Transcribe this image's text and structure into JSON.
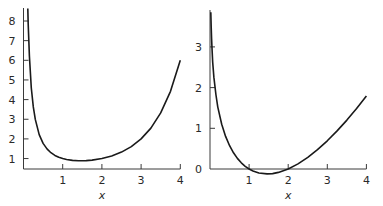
{
  "chart_data": [
    {
      "type": "line",
      "title": "",
      "xlabel": "x",
      "ylabel": "",
      "xlim": [
        0,
        4
      ],
      "ylim": [
        0.55,
        8.5
      ],
      "grid": false,
      "xticks": [
        "1",
        "2",
        "3",
        "4"
      ],
      "yticks": [
        "1",
        "2",
        "3",
        "4",
        "5",
        "6",
        "7",
        "8"
      ],
      "series": [
        {
          "name": "curve",
          "x": [
            0.11,
            0.12,
            0.15,
            0.2,
            0.25,
            0.3,
            0.4,
            0.5,
            0.6,
            0.7,
            0.8,
            0.9,
            1.0,
            1.1,
            1.25,
            1.4,
            1.46,
            1.6,
            1.75,
            2.0,
            2.25,
            2.5,
            2.75,
            3.0,
            3.25,
            3.5,
            3.75,
            4.0
          ],
          "y": [
            8.63,
            7.85,
            6.22,
            4.59,
            3.63,
            2.99,
            2.22,
            1.77,
            1.49,
            1.3,
            1.16,
            1.07,
            1.0,
            0.951,
            0.906,
            0.887,
            0.886,
            0.894,
            0.919,
            1.0,
            1.133,
            1.329,
            1.608,
            2.0,
            2.549,
            3.323,
            4.423,
            6.0
          ]
        }
      ]
    },
    {
      "type": "line",
      "title": "",
      "xlabel": "x",
      "ylabel": "",
      "xlim": [
        0,
        4
      ],
      "ylim": [
        0,
        3.85
      ],
      "grid": false,
      "xticks": [
        "1",
        "2",
        "3",
        "4"
      ],
      "yticks": [
        "0",
        "1",
        "2",
        "3"
      ],
      "series": [
        {
          "name": "curve",
          "x": [
            0.021,
            0.03,
            0.04,
            0.05,
            0.07,
            0.1,
            0.15,
            0.2,
            0.3,
            0.4,
            0.5,
            0.6,
            0.7,
            0.8,
            0.9,
            1.0,
            1.1,
            1.25,
            1.46,
            1.6,
            1.75,
            2.0,
            2.25,
            2.5,
            2.75,
            3.0,
            3.25,
            3.5,
            3.75,
            4.0
          ],
          "y": [
            3.85,
            3.49,
            3.2,
            2.97,
            2.62,
            2.25,
            1.83,
            1.52,
            1.1,
            0.8,
            0.572,
            0.398,
            0.261,
            0.152,
            0.066,
            0.0,
            -0.049,
            -0.098,
            -0.121,
            -0.112,
            -0.084,
            0.0,
            0.125,
            0.285,
            0.475,
            0.693,
            0.936,
            1.201,
            1.487,
            1.792
          ]
        }
      ]
    }
  ]
}
